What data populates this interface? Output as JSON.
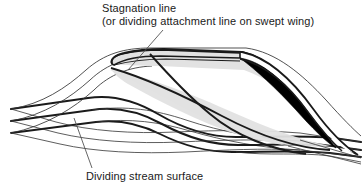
{
  "figure": {
    "background_color": "#ffffff",
    "width": 364,
    "height": 192
  },
  "labels": {
    "stagnation": {
      "line1": "Stagnation line",
      "line2": "(or dividing attachment line on swept wing)"
    },
    "dividing": {
      "line1": "Dividing stream surface"
    }
  },
  "colors": {
    "stroke": "#1a1a1a",
    "thin_stroke": "#333333",
    "airfoil_fill": "#000000",
    "wing_upper_fill": "#e2e2e2",
    "wing_side_fill": "#dcdcdc",
    "white": "#ffffff"
  },
  "annotations": {
    "leader_stagnation": "leader-line-to-leading-edge",
    "leader_dividing": "leader-line-to-stream-surface"
  },
  "elements": {
    "wing": "swept-wing-body",
    "airfoil_section": "black-airfoil-cross-section",
    "stagnation_line": "stagnation-attachment-line",
    "stream_surfaces": "three-dividing-stream-surfaces"
  }
}
